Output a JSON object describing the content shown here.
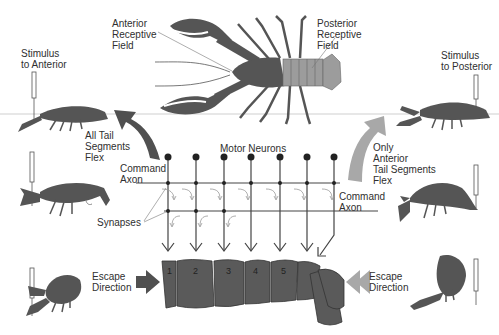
{
  "labels": {
    "anterior_field": "Anterior\nReceptive\nField",
    "posterior_field": "Posterior\nReceptive\nField",
    "stimulus_anterior": "Stimulus\nto Anterior",
    "stimulus_posterior": "Stimulus\nto Posterior",
    "all_tail_flex": "All Tail\nSegments\nFlex",
    "only_anterior_flex": "Only\nAnterior\nTail Segments\nFlex",
    "motor_neurons": "Motor Neurons",
    "command_axon_left": "Command\nAxon",
    "command_axon_right": "Command\nAxon",
    "synapses": "Synapses",
    "escape_left": "Escape\nDirection",
    "escape_right": "Escape\nDirection"
  },
  "tail_segments": [
    "1",
    "2",
    "3",
    "4",
    "5"
  ],
  "colors": {
    "body_dark": "#555555",
    "tail_light": "#9a9a9a",
    "arrow_dark": "#505050",
    "arrow_light": "#a8a8a8",
    "line": "#444444"
  }
}
